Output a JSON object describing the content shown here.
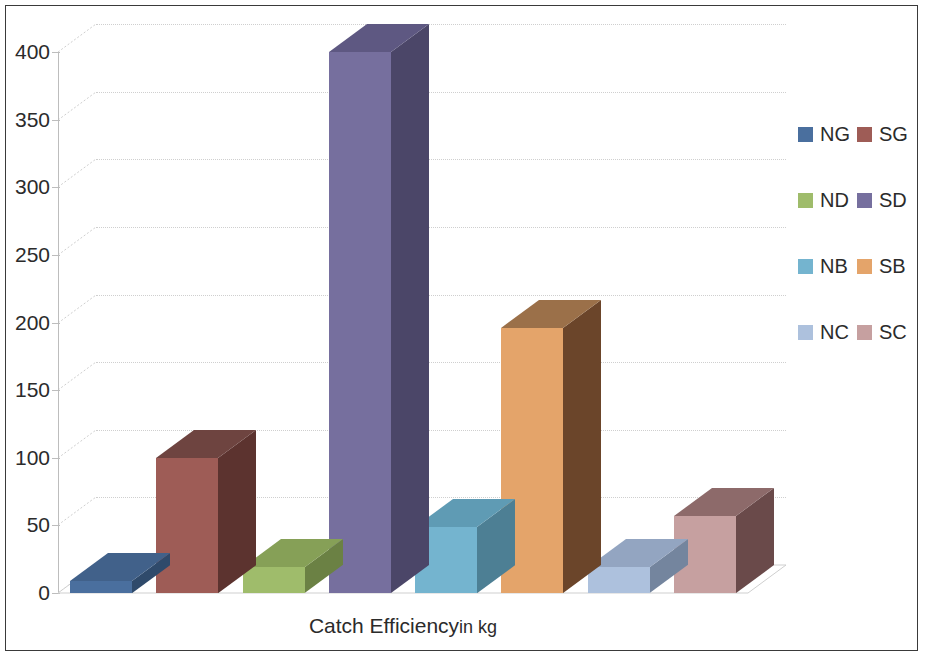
{
  "chart_data": {
    "type": "bar",
    "title": "",
    "subtitle": "",
    "xlabel": "Catch Efficiency in kg",
    "xlabel_main": "Catch Efficiency",
    "xlabel_unit": "in kg",
    "ylabel": "",
    "ylim": [
      0,
      400
    ],
    "ytick_step": 50,
    "yticks": [
      "400",
      "350",
      "300",
      "250",
      "200",
      "150",
      "100",
      "50",
      "0"
    ],
    "ytick_values": [
      400,
      350,
      300,
      250,
      200,
      150,
      100,
      50,
      0
    ],
    "grid": true,
    "grid_axis": "y",
    "legend_position": "right",
    "three_d": true,
    "categories": [
      "NG",
      "SG",
      "ND",
      "SD",
      "NB",
      "SB",
      "NC",
      "SC"
    ],
    "values": [
      9,
      100,
      19,
      400,
      49,
      196,
      19,
      57
    ],
    "series": [
      {
        "name": "Catch Efficiency in kg",
        "values": [
          9,
          100,
          19,
          400,
          49,
          196,
          19,
          57
        ]
      }
    ],
    "bars": [
      {
        "label": "NG",
        "value": 9,
        "color": "#4a6f9e",
        "side_color": "#2f4a6b",
        "top_color": "#41618a"
      },
      {
        "label": "SG",
        "value": 100,
        "color": "#9e5c56",
        "side_color": "#5c332f",
        "top_color": "#6e4440"
      },
      {
        "label": "ND",
        "value": 19,
        "color": "#9fbc6b",
        "side_color": "#6b8144",
        "top_color": "#86a057"
      },
      {
        "label": "SD",
        "value": 400,
        "color": "#766f9e",
        "side_color": "#4b4668",
        "top_color": "#5e5882"
      },
      {
        "label": "NB",
        "value": 49,
        "color": "#74b4cf",
        "side_color": "#4d7f94",
        "top_color": "#5f9bb4"
      },
      {
        "label": "SB",
        "value": 196,
        "color": "#e4a46a",
        "side_color": "#6b452a",
        "top_color": "#9b7049"
      },
      {
        "label": "NC",
        "value": 19,
        "color": "#adc1dd",
        "side_color": "#74859e",
        "top_color": "#93a5c1"
      },
      {
        "label": "SC",
        "value": 57,
        "color": "#c6a0a0",
        "side_color": "#6a4a4a",
        "top_color": "#8d6a6a"
      }
    ]
  },
  "axis": {
    "y_tick_labels": [
      "400",
      "350",
      "300",
      "250",
      "200",
      "150",
      "100",
      "50",
      "0"
    ],
    "x_title_main": "Catch Efficiency",
    "x_title_unit": "in kg"
  },
  "legend": {
    "rows": [
      {
        "left": {
          "label": "NG",
          "color": "#4a6f9e"
        },
        "right": {
          "label": "SG",
          "color": "#9e5c56"
        }
      },
      {
        "left": {
          "label": "ND",
          "color": "#9fbc6b"
        },
        "right": {
          "label": "SD",
          "color": "#766f9e"
        }
      },
      {
        "left": {
          "label": "NB",
          "color": "#74b4cf"
        },
        "right": {
          "label": "SB",
          "color": "#e4a46a"
        }
      },
      {
        "left": {
          "label": "NC",
          "color": "#adc1dd"
        },
        "right": {
          "label": "SC",
          "color": "#c6a0a0"
        }
      }
    ]
  },
  "style": {
    "border_color": "#3a3a3a",
    "grid_color": "#cfcfcf",
    "axis_color": "#bdbdbd",
    "text_color": "#2b2b2b",
    "background": "#ffffff"
  }
}
